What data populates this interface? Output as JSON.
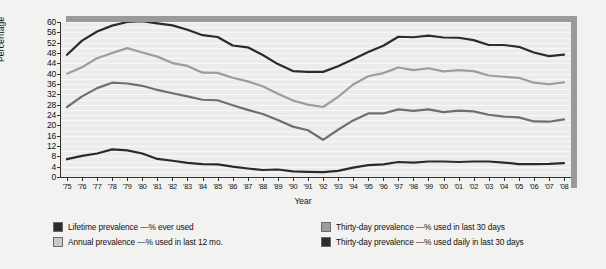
{
  "chart_data": {
    "type": "line",
    "title": "",
    "xlabel": "Year",
    "ylabel": "Percentage",
    "ylim": [
      0,
      60
    ],
    "ytick_step": 4,
    "yticks": [
      0,
      4,
      8,
      12,
      16,
      20,
      24,
      28,
      32,
      36,
      40,
      44,
      48,
      52,
      56,
      60
    ],
    "grid": true,
    "legend_position": "bottom",
    "x": [
      1975,
      1976,
      1977,
      1978,
      1979,
      1980,
      1981,
      1982,
      1983,
      1984,
      1985,
      1986,
      1987,
      1988,
      1989,
      1990,
      1991,
      1992,
      1993,
      1994,
      1995,
      1996,
      1997,
      1998,
      1999,
      2000,
      2001,
      2002,
      2003,
      2004,
      2005,
      2006,
      2007,
      2008
    ],
    "categories": [
      "'75",
      "'76",
      "'77",
      "'78",
      "'79",
      "'80",
      "'81",
      "'82",
      "'83",
      "'84",
      "'85",
      "'86",
      "'87",
      "'88",
      "'89",
      "'90",
      "'91",
      "'92",
      "'93",
      "'94",
      "'95",
      "'96",
      "'97",
      "'98",
      "'99",
      "'00",
      "'01",
      "'02",
      "'03",
      "'04",
      "'05",
      "'06",
      "'07",
      "'08"
    ],
    "series": [
      {
        "name": "Lifetime prevalence —% ever used",
        "key": "lifetime",
        "color": "#2b2b2b",
        "values": [
          47.3,
          52.8,
          56.3,
          58.6,
          60.0,
          60.3,
          59.5,
          58.7,
          57.0,
          54.9,
          54.2,
          50.9,
          50.2,
          47.2,
          43.7,
          41.0,
          40.7,
          40.7,
          42.9,
          45.6,
          48.4,
          50.8,
          54.3,
          54.1,
          54.7,
          54.0,
          53.9,
          53.0,
          51.1,
          51.1,
          50.4,
          48.2,
          46.8,
          47.4
        ]
      },
      {
        "name": "Annual prevalence —% used in last 12 mo.",
        "key": "annual",
        "color": "#9d9d9d",
        "values": [
          40.0,
          42.5,
          46.0,
          48.0,
          49.9,
          48.2,
          46.6,
          44.1,
          43.0,
          40.4,
          40.3,
          38.4,
          37.0,
          35.1,
          32.2,
          29.6,
          28.0,
          27.1,
          31.0,
          35.8,
          39.0,
          40.2,
          42.4,
          41.4,
          42.1,
          40.9,
          41.4,
          41.0,
          39.3,
          38.8,
          38.4,
          36.5,
          35.9,
          36.6
        ]
      },
      {
        "name": "Thirty-day prevalence —% used in last 30 days",
        "key": "thirty_day",
        "color": "#6f6f6f",
        "values": [
          27.1,
          31.2,
          34.4,
          36.5,
          36.2,
          35.3,
          33.7,
          32.4,
          31.2,
          29.9,
          29.7,
          27.8,
          26.0,
          24.4,
          22.1,
          19.5,
          18.1,
          14.4,
          18.3,
          21.9,
          24.6,
          24.6,
          26.2,
          25.6,
          26.2,
          25.1,
          25.7,
          25.4,
          24.1,
          23.4,
          23.1,
          21.5,
          21.4,
          22.3
        ]
      },
      {
        "name": "Thirty-day prevalence —% used daily in last 30 days",
        "key": "daily",
        "color": "#2b2b2b",
        "values": [
          6.9,
          8.2,
          9.1,
          10.7,
          10.3,
          9.1,
          7.0,
          6.3,
          5.5,
          5.0,
          4.9,
          4.0,
          3.3,
          2.7,
          2.9,
          2.2,
          2.0,
          1.9,
          2.4,
          3.6,
          4.6,
          4.9,
          5.8,
          5.6,
          6.0,
          6.0,
          5.8,
          6.0,
          6.0,
          5.6,
          5.0,
          5.0,
          5.1,
          5.4
        ]
      }
    ]
  },
  "legend": {
    "items": [
      {
        "label": "Lifetime prevalence —% ever used",
        "color": "#2b2b2b"
      },
      {
        "label": "Thirty-day prevalence —% used in last 30 days",
        "color": "#9d9d9d"
      },
      {
        "label": "Annual prevalence —% used in last 12 mo.",
        "color": "#c9c9c9"
      },
      {
        "label": "Thirty-day prevalence —% used daily in last 30 days",
        "color": "#2b2b2b"
      }
    ]
  },
  "colors": {
    "background": "#f2f2f0",
    "plot_background": "#ececea",
    "frame": "#9a9a9a",
    "axis": "#333333"
  }
}
